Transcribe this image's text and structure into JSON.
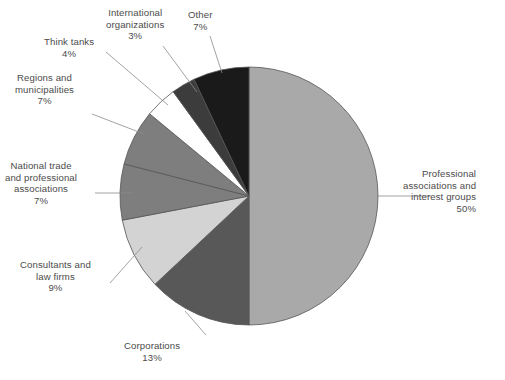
{
  "figure": {
    "background_color": "#ffffff",
    "text_color": "#4b4b4b",
    "leader_line_color": "#8c8c8c",
    "slice_outline_color": "#555555"
  },
  "chart_data": {
    "type": "pie",
    "title": "",
    "subtitle": "",
    "xlabel": "",
    "ylabel": "",
    "grid": false,
    "legend_position": "none",
    "labels_outside": true,
    "value_suffix": "%",
    "total": 100,
    "start_angle_deg": 0,
    "direction": "clockwise",
    "center": {
      "x": 249,
      "y": 196,
      "radius": 129
    },
    "categories": [
      "Professional associations and interest groups",
      "Corporations",
      "Consultants and law firms",
      "National trade and professional associations",
      "Regions and municipalities",
      "Think tanks",
      "International organizations",
      "Other"
    ],
    "values": [
      50,
      13,
      9,
      7,
      7,
      4,
      3,
      7
    ],
    "colors": [
      "#a9a9a9",
      "#585858",
      "#d3d3d3",
      "#7e7e7e",
      "#7e7e7e",
      "#ffffff",
      "#3c3c3c",
      "#1a1a1a"
    ],
    "slices": [
      {
        "name": "Professional associations and interest groups",
        "value": 50,
        "value_label": "50%",
        "color": "#a9a9a9",
        "label_lines": [
          "Professional",
          "associations and",
          "interest groups"
        ],
        "label_align": "right",
        "label_x": 403,
        "label_y": 168,
        "leader": {
          "x1": 378,
          "y1": 196,
          "x2": 431,
          "y2": 196
        }
      },
      {
        "name": "Corporations",
        "value": 13,
        "value_label": "13%",
        "color": "#585858",
        "label_lines": [
          "Corporations"
        ],
        "label_align": "center",
        "label_x": 124,
        "label_y": 340,
        "leader": {
          "x1": 185,
          "y1": 311,
          "x2": 206,
          "y2": 335
        }
      },
      {
        "name": "Consultants and law firms",
        "value": 9,
        "value_label": "9%",
        "color": "#d3d3d3",
        "label_lines": [
          "Consultants and",
          "law firms"
        ],
        "label_align": "center",
        "label_x": 20,
        "label_y": 259,
        "leader": {
          "x1": 110,
          "y1": 283,
          "x2": 142,
          "y2": 247
        }
      },
      {
        "name": "National trade and professional associations",
        "value": 7,
        "value_label": "7%",
        "color": "#7e7e7e",
        "label_lines": [
          "National trade",
          "and professional",
          "associations"
        ],
        "label_align": "center",
        "label_x": 5,
        "label_y": 160,
        "leader": {
          "x1": 95,
          "y1": 193,
          "x2": 133,
          "y2": 193
        }
      },
      {
        "name": "Regions and municipalities",
        "value": 7,
        "value_label": "7%",
        "color": "#7e7e7e",
        "label_lines": [
          "Regions and",
          "municipalities"
        ],
        "label_align": "center",
        "label_x": 15,
        "label_y": 72,
        "leader": {
          "x1": 92,
          "y1": 114,
          "x2": 144,
          "y2": 134
        }
      },
      {
        "name": "Think tanks",
        "value": 4,
        "value_label": "4%",
        "color": "#ffffff",
        "label_lines": [
          "Think tanks"
        ],
        "label_align": "center",
        "label_x": 44,
        "label_y": 36,
        "leader": {
          "x1": 106,
          "y1": 52,
          "x2": 168,
          "y2": 105
        }
      },
      {
        "name": "International organizations",
        "value": 3,
        "value_label": "3%",
        "color": "#3c3c3c",
        "label_lines": [
          "International",
          "organizations"
        ],
        "label_align": "center",
        "label_x": 106,
        "label_y": 7,
        "leader": {
          "x1": 163,
          "y1": 46,
          "x2": 197,
          "y2": 92
        }
      },
      {
        "name": "Other",
        "value": 7,
        "value_label": "7%",
        "color": "#1a1a1a",
        "label_lines": [
          "Other"
        ],
        "label_align": "center",
        "label_x": 188,
        "label_y": 9,
        "leader": {
          "x1": 210,
          "y1": 36,
          "x2": 222,
          "y2": 73
        }
      }
    ]
  }
}
